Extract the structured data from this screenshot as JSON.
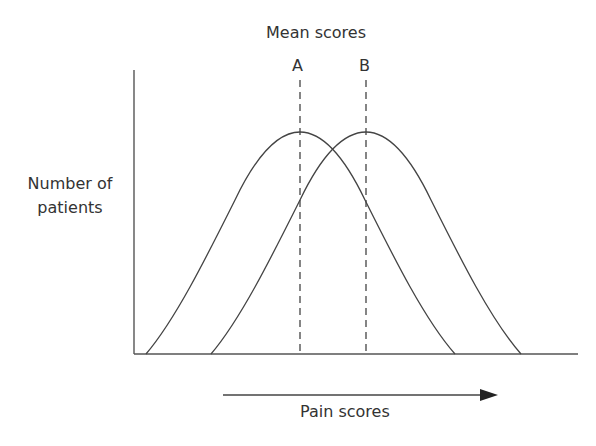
{
  "title": "Mean scores",
  "markers": [
    {
      "label": "A",
      "x_px": 300
    },
    {
      "label": "B",
      "x_px": 366
    }
  ],
  "y_axis_label_line1": "Number of",
  "y_axis_label_line2": "patients",
  "x_axis_label": "Pain scores",
  "colors": {
    "line": "#444444",
    "text": "#333333"
  },
  "diagram": {
    "type": "two overlapping normal distributions",
    "curves": [
      {
        "name": "A",
        "start_x": 146,
        "peak_x": 300,
        "end_x": 455,
        "peak_y": 132
      },
      {
        "name": "B",
        "start_x": 211,
        "peak_x": 366,
        "end_x": 521,
        "peak_y": 132
      }
    ],
    "axis_origin": [
      134,
      354
    ],
    "arrow": {
      "from_x": 223,
      "to_x": 498,
      "y": 395
    }
  }
}
